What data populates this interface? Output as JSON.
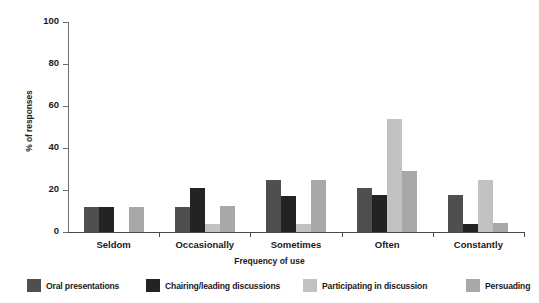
{
  "chart_data": {
    "type": "bar",
    "title": "",
    "xlabel": "Frequency of use",
    "ylabel": "% of responses",
    "categories": [
      "Seldom",
      "Occasionally",
      "Sometimes",
      "Often",
      "Constantly"
    ],
    "ylim": [
      0,
      100
    ],
    "yticks": [
      0,
      20,
      40,
      60,
      80,
      100
    ],
    "grid": false,
    "legend_position": "bottom",
    "series": [
      {
        "name": "Oral presentations",
        "color": "#4f4f4f",
        "values": [
          12,
          12,
          25,
          21,
          17.5
        ]
      },
      {
        "name": "Chairing/leading discussions",
        "color": "#232323",
        "values": [
          12,
          21,
          17,
          17.5,
          4
        ]
      },
      {
        "name": "Participating in discussion",
        "color": "#c2c2c2",
        "values": [
          0,
          4,
          4,
          54,
          25
        ]
      },
      {
        "name": "Persuading",
        "color": "#a8a8a8",
        "values": [
          12,
          12.5,
          25,
          29,
          4.5
        ]
      }
    ]
  },
  "axis": {
    "y_tick_labels": [
      "0",
      "20",
      "40",
      "60",
      "80",
      "100"
    ]
  }
}
